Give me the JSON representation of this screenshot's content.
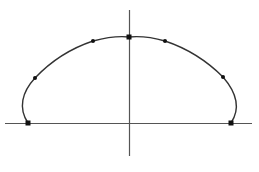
{
  "diagram": {
    "type": "curve-on-axes",
    "colors": {
      "background": "#ffffff",
      "axis": "#555555",
      "curve": "#333333",
      "marker": "#111111"
    },
    "axes": {
      "horizontal": {
        "x1": 5,
        "y1": 123.5,
        "x2": 252,
        "y2": 123.5
      },
      "vertical": {
        "x1": 129.5,
        "y1": 10,
        "x2": 129.5,
        "y2": 156
      }
    },
    "curve_path": "M 28 123 C 18 108, 22 92, 35 78 C 52 60, 72 48, 93 41 C 108 37, 120 36, 129 37 C 139 36, 151 37, 165 41 C 186 48, 206 60, 223 77 C 236 92, 241 108, 231 123",
    "square_markers": [
      {
        "name": "left-endpoint",
        "x": 28,
        "y": 123
      },
      {
        "name": "apex",
        "x": 129,
        "y": 37
      },
      {
        "name": "right-endpoint",
        "x": 231,
        "y": 123
      }
    ],
    "dot_markers": [
      {
        "name": "left-lower",
        "x": 35,
        "y": 78
      },
      {
        "name": "left-upper",
        "x": 93,
        "y": 41
      },
      {
        "name": "right-upper",
        "x": 165,
        "y": 41
      },
      {
        "name": "right-lower",
        "x": 223,
        "y": 77
      }
    ]
  }
}
